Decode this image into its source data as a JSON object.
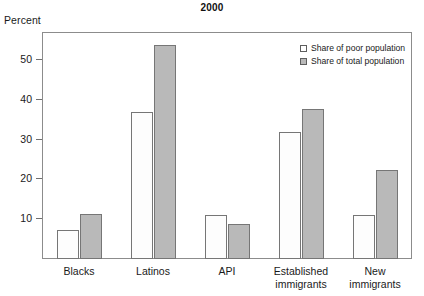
{
  "chart_data": {
    "type": "bar",
    "title": "2000",
    "xlabel": "",
    "ylabel": "Percent",
    "ylim": [
      0,
      57
    ],
    "yticks": [
      10,
      20,
      30,
      40,
      50
    ],
    "grid": false,
    "legend_position": "top-right",
    "categories": [
      "Blacks",
      "Latinos",
      "API",
      "Established immigrants",
      "New immigrants"
    ],
    "category_labels": [
      {
        "line1": "Blacks",
        "line2": ""
      },
      {
        "line1": "Latinos",
        "line2": ""
      },
      {
        "line1": "API",
        "line2": ""
      },
      {
        "line1": "Established",
        "line2": "immigrants"
      },
      {
        "line1": "New",
        "line2": "immigrants"
      }
    ],
    "series": [
      {
        "name": "Share of poor population",
        "color": "#ffffff",
        "values": [
          7.4,
          37.0,
          11.0,
          31.8,
          11.1
        ]
      },
      {
        "name": "Share of total population",
        "color": "#b9b9b9",
        "values": [
          11.4,
          53.8,
          8.9,
          37.6,
          22.3
        ]
      }
    ]
  },
  "legend": {
    "items": [
      {
        "label": "Share of poor population",
        "swatch": "poor"
      },
      {
        "label": "Share of total population",
        "swatch": "total"
      }
    ]
  },
  "colors": {
    "bar_poor_fill": "#fdfdfd",
    "bar_total_fill": "#b9b9b9",
    "bar_outline": "#767676",
    "frame": "#8c8c8c",
    "text": "#1a1a1a"
  }
}
